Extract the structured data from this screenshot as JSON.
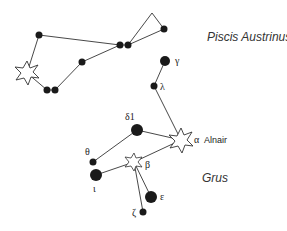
{
  "diagram": {
    "type": "star-chart",
    "constellations": [
      {
        "name": "Piscis Austrinus",
        "label_pos": [
          207,
          37
        ],
        "stars": [
          {
            "id": "pa1",
            "x": 39,
            "y": 35,
            "r": 3.5
          },
          {
            "id": "fomalhaut",
            "x": 27,
            "y": 73,
            "shape": "open-star"
          },
          {
            "id": "pa3",
            "x": 47,
            "y": 90,
            "r": 3.5
          },
          {
            "id": "pa4",
            "x": 55,
            "y": 90,
            "r": 3.5
          },
          {
            "id": "pa5",
            "x": 82,
            "y": 62,
            "r": 3.5
          },
          {
            "id": "pa6",
            "x": 120,
            "y": 45,
            "r": 3.5
          },
          {
            "id": "pa7",
            "x": 128,
            "y": 45,
            "r": 3.5
          },
          {
            "id": "pa8",
            "x": 164,
            "y": 29,
            "r": 3.5
          }
        ]
      },
      {
        "name": "Grus",
        "label_pos": [
          202,
          178
        ],
        "stars": [
          {
            "id": "gamma",
            "label": "γ",
            "x": 165,
            "y": 61,
            "r": 5
          },
          {
            "id": "lambda",
            "label": "λ",
            "x": 154,
            "y": 86,
            "r": 3.5
          },
          {
            "id": "alpha",
            "label": "α",
            "name": "Alnair",
            "x": 181,
            "y": 140,
            "shape": "open-star"
          },
          {
            "id": "delta1",
            "label": "δ1",
            "x": 137,
            "y": 130,
            "r": 6
          },
          {
            "id": "theta",
            "label": "θ",
            "x": 93,
            "y": 162,
            "r": 3.5
          },
          {
            "id": "beta",
            "label": "β",
            "x": 134,
            "y": 162,
            "shape": "open-star"
          },
          {
            "id": "iota",
            "label": "ι",
            "x": 96,
            "y": 175,
            "r": 6
          },
          {
            "id": "epsilon",
            "label": "ε",
            "x": 151,
            "y": 197,
            "r": 6
          },
          {
            "id": "zeta",
            "label": "ζ",
            "x": 143,
            "y": 212,
            "r": 3.5
          }
        ]
      }
    ],
    "labels": {
      "piscis_austrinus": "Piscis Austrinus",
      "grus": "Grus",
      "gamma": "γ",
      "lambda": "λ",
      "alpha": "α",
      "alnair": "Alnair",
      "delta1": "δ1",
      "theta": "θ",
      "beta": "β",
      "iota": "ι",
      "epsilon": "ε",
      "zeta": "ζ"
    },
    "colors": {
      "star_fill": "#1a1a1a",
      "line": "#333333",
      "open_star_fill": "#ffffff"
    }
  }
}
